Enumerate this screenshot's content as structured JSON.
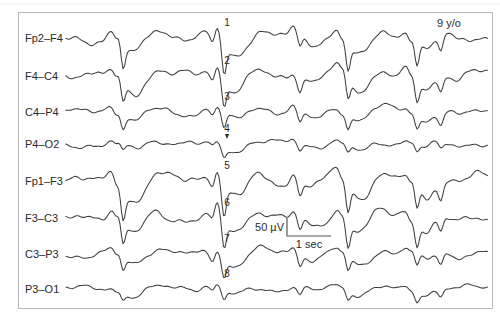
{
  "figure": {
    "annotation_age": "9 y/o",
    "scale_bar": {
      "voltage_label": "50 µV",
      "time_label": "1 sec"
    }
  },
  "chart_data": {
    "type": "line",
    "annotation": "9 y/o",
    "legend_position": "none",
    "grid": false,
    "trace_color": "#3f3f3f",
    "x_range_px": [
      66,
      488
    ],
    "marker_x": 227,
    "scale_bar": {
      "voltage_label": "50 µV",
      "time_label": "1 sec",
      "seconds_px": 44,
      "microvolts_px": 18
    },
    "channels": [
      {
        "label": "Fp2–F4",
        "baseline": 38,
        "marker": "1",
        "arrow": false
      },
      {
        "label": "F4–C4",
        "baseline": 76,
        "marker": "2",
        "arrow": false
      },
      {
        "label": "C4–P4",
        "baseline": 112,
        "marker": "3",
        "arrow": false
      },
      {
        "label": "P4–O2",
        "baseline": 144,
        "marker": "4",
        "arrow": true
      },
      {
        "label": "Fp1–F3",
        "baseline": 181,
        "marker": "5",
        "arrow": false
      },
      {
        "label": "F3–C3",
        "baseline": 218,
        "marker": "6",
        "arrow": false
      },
      {
        "label": "C3–P3",
        "baseline": 254,
        "marker": "7",
        "arrow": false
      },
      {
        "label": "P3–O1",
        "baseline": 289,
        "marker": "8",
        "arrow": false
      }
    ],
    "events": [
      {
        "x": 116,
        "depths": [
          12,
          10,
          7,
          4,
          13,
          11,
          8,
          4
        ]
      },
      {
        "x": 123,
        "depths": [
          26,
          22,
          14,
          7,
          28,
          24,
          15,
          8
        ]
      },
      {
        "x": 213,
        "depths": [
          10,
          9,
          6,
          4,
          10,
          9,
          7,
          4
        ]
      },
      {
        "x": 224,
        "depths": [
          30,
          26,
          16,
          9,
          30,
          28,
          18,
          10
        ]
      },
      {
        "x": 300,
        "depths": [
          13,
          12,
          10,
          6,
          13,
          12,
          11,
          6
        ]
      },
      {
        "x": 341,
        "depths": [
          12,
          10,
          6,
          4,
          12,
          10,
          7,
          4
        ]
      },
      {
        "x": 348,
        "depths": [
          27,
          24,
          14,
          8,
          27,
          25,
          15,
          9
        ]
      },
      {
        "x": 410,
        "depths": [
          11,
          10,
          6,
          4,
          11,
          10,
          6,
          4
        ]
      },
      {
        "x": 417,
        "depths": [
          25,
          22,
          13,
          8,
          24,
          22,
          13,
          8
        ]
      },
      {
        "x": 441,
        "depths": [
          15,
          13,
          10,
          6,
          15,
          13,
          10,
          6
        ]
      }
    ],
    "waveform_synthesis": {
      "amps": [
        5.5,
        5.0,
        4.2,
        3.6,
        5.5,
        5.0,
        4.2,
        3.6
      ],
      "freqs": [
        0.082,
        0.2,
        0.046,
        0.31,
        0.55
      ],
      "weights": [
        0.55,
        0.3,
        0.38,
        0.18,
        0.13
      ]
    }
  }
}
